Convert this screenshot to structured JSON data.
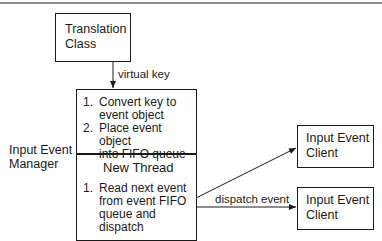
{
  "diagram": {
    "type": "flow",
    "colors": {
      "stroke": "#1a1a1a",
      "rule": "#8c8c8c",
      "background": "#ffffff"
    },
    "translation_box": {
      "line1": "Translation",
      "line2": "Class"
    },
    "edge_virtual_key": {
      "label": "virtual key"
    },
    "manager_label": {
      "line1": "Input Event",
      "line2": "Manager"
    },
    "manager_box": {
      "steps": [
        {
          "num": "1.",
          "line1": "Convert key to",
          "line2": "event object"
        },
        {
          "num": "2.",
          "line1": "Place event object",
          "line2": "into FIFO queue"
        }
      ],
      "thread": {
        "title": "New Thread",
        "steps": [
          {
            "num": "1.",
            "line1": "Read next event",
            "line2": "from event FIFO",
            "line3": "queue and dispatch"
          }
        ]
      }
    },
    "edge_dispatch": {
      "label": "dispatch event"
    },
    "clients": [
      {
        "line1": "Input Event",
        "line2": "Client"
      },
      {
        "line1": "Input Event",
        "line2": "Client"
      }
    ]
  }
}
